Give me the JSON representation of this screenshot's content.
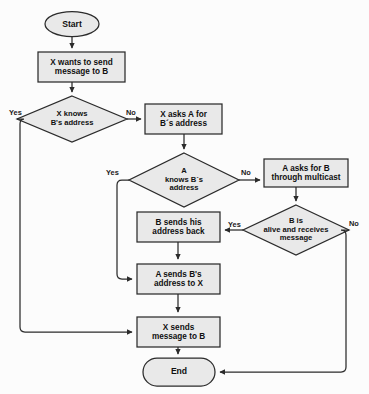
{
  "diagram": {
    "background_color": "#fcfcfc",
    "node_fill": "#e9e9e9",
    "node_stroke": "#2b2b2b",
    "edge_stroke": "#2b2b2b",
    "nodes": [
      {
        "id": "start",
        "shape": "ellipse",
        "label": "Start"
      },
      {
        "id": "x_wants",
        "shape": "process",
        "label": "X wants to send\nmessage to B"
      },
      {
        "id": "x_knows",
        "shape": "decision",
        "label": "X knows\nB's address"
      },
      {
        "id": "x_asks_a",
        "shape": "process",
        "label": "X asks A for\nB´s address"
      },
      {
        "id": "a_knows",
        "shape": "decision",
        "label": "A\nknows B´s\naddress"
      },
      {
        "id": "a_multicast",
        "shape": "process",
        "label": "A asks for B\nthrough multicast"
      },
      {
        "id": "b_alive",
        "shape": "decision",
        "label": "B is\nalive and receives\nmessage"
      },
      {
        "id": "b_sends",
        "shape": "process",
        "label": "B sends his\naddress back"
      },
      {
        "id": "a_sends",
        "shape": "process",
        "label": "A sends B's\naddress to X"
      },
      {
        "id": "x_sends",
        "shape": "process",
        "label": "X sends\nmessage to B"
      },
      {
        "id": "end",
        "shape": "terminal",
        "label": "End"
      }
    ],
    "edge_labels": [
      {
        "id": "x_knows_yes",
        "text": "Yes"
      },
      {
        "id": "x_knows_no",
        "text": "No"
      },
      {
        "id": "a_knows_yes",
        "text": "Yes"
      },
      {
        "id": "a_knows_no",
        "text": "No"
      },
      {
        "id": "b_alive_yes",
        "text": "Yes"
      },
      {
        "id": "b_alive_no",
        "text": "No"
      }
    ]
  }
}
